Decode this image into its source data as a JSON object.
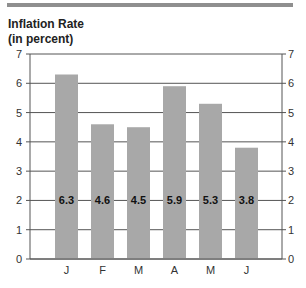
{
  "chart_data": {
    "type": "bar",
    "title": "Inflation Rate",
    "subtitle": "(in percent)",
    "xlabel": "",
    "ylabel": "",
    "categories": [
      "J",
      "F",
      "M",
      "A",
      "M",
      "J"
    ],
    "values": [
      6.3,
      4.6,
      4.5,
      5.9,
      5.3,
      3.8
    ],
    "data_labels": [
      "6.3",
      "4.6",
      "4.5",
      "5.9",
      "5.3",
      "3.8"
    ],
    "ylim": [
      0,
      7
    ],
    "yticks": [
      0,
      1,
      2,
      3,
      4,
      5,
      6,
      7
    ],
    "grid": true,
    "y_axis_both_sides": true,
    "legend": "none",
    "colors": {
      "bar": "#a8a8a8",
      "grid": "#555555",
      "axis": "#555555",
      "topbar": "#8f8f8f"
    }
  }
}
